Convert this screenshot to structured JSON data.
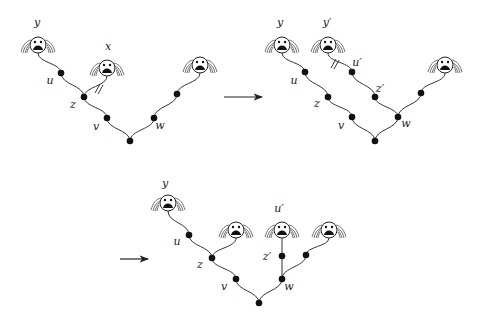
{
  "figure": {
    "panels": [
      {
        "id": "panel-1",
        "heads": [
          {
            "id": "h-y",
            "label": "y",
            "x": 38,
            "y": 45,
            "label_x": 37,
            "label_y": 26
          },
          {
            "id": "h-x",
            "label": "x",
            "x": 107,
            "y": 68,
            "label_x": 108,
            "label_y": 50
          },
          {
            "id": "h-r",
            "label": "",
            "x": 200,
            "y": 65
          }
        ],
        "nodes": [
          {
            "id": "u",
            "label": "u",
            "x": 61,
            "y": 73,
            "label_x": 50,
            "label_y": 84
          },
          {
            "id": "z",
            "label": "z",
            "x": 84,
            "y": 97,
            "label_x": 73,
            "label_y": 108
          },
          {
            "id": "v",
            "label": "v",
            "x": 107,
            "y": 118,
            "label_x": 96,
            "label_y": 130
          },
          {
            "id": "root",
            "label": "",
            "x": 130,
            "y": 141
          },
          {
            "id": "w",
            "label": "w",
            "x": 154,
            "y": 118,
            "label_x": 160,
            "label_y": 129
          },
          {
            "id": "r1",
            "label": "",
            "x": 177,
            "y": 94
          }
        ],
        "edges": [
          [
            "h-y",
            "u"
          ],
          [
            "u",
            "z"
          ],
          [
            "z",
            "h-x"
          ],
          [
            "z",
            "v"
          ],
          [
            "v",
            "root"
          ],
          [
            "root",
            "w"
          ],
          [
            "w",
            "r1"
          ],
          [
            "r1",
            "h-r"
          ]
        ],
        "cut_edge": {
          "x": 99,
          "y": 89
        }
      },
      {
        "id": "panel-2",
        "heads": [
          {
            "id": "h-y",
            "label": "y",
            "x": 282,
            "y": 45,
            "label_x": 280,
            "label_y": 26
          },
          {
            "id": "h-y2",
            "label": "y′",
            "x": 328,
            "y": 45,
            "label_x": 327,
            "label_y": 26
          },
          {
            "id": "h-r",
            "label": "",
            "x": 445,
            "y": 65
          }
        ],
        "nodes": [
          {
            "id": "u",
            "label": "u",
            "x": 305,
            "y": 72,
            "label_x": 294,
            "label_y": 84
          },
          {
            "id": "u2",
            "label": "u′",
            "x": 352,
            "y": 72,
            "label_x": 357,
            "label_y": 66
          },
          {
            "id": "z",
            "label": "z",
            "x": 328,
            "y": 97,
            "label_x": 317,
            "label_y": 107
          },
          {
            "id": "z2",
            "label": "z′",
            "x": 375,
            "y": 97,
            "label_x": 380,
            "label_y": 92
          },
          {
            "id": "v",
            "label": "v",
            "x": 352,
            "y": 117,
            "label_x": 341,
            "label_y": 129
          },
          {
            "id": "w",
            "label": "w",
            "x": 398,
            "y": 117,
            "label_x": 406,
            "label_y": 127
          },
          {
            "id": "root",
            "label": "",
            "x": 375,
            "y": 141
          },
          {
            "id": "r1",
            "label": "",
            "x": 421,
            "y": 93
          }
        ],
        "edges": [
          [
            "h-y",
            "u"
          ],
          [
            "u",
            "z"
          ],
          [
            "z",
            "v"
          ],
          [
            "v",
            "root"
          ],
          [
            "root",
            "w"
          ],
          [
            "w",
            "z2"
          ],
          [
            "z2",
            "u2"
          ],
          [
            "u2",
            "h-y2"
          ],
          [
            "w",
            "r1"
          ],
          [
            "r1",
            "h-r"
          ]
        ],
        "cut_edge": {
          "x": 335,
          "y": 64
        }
      },
      {
        "id": "panel-3",
        "heads": [
          {
            "id": "h-y",
            "label": "y",
            "x": 168,
            "y": 203,
            "label_x": 165,
            "label_y": 187
          },
          {
            "id": "h-z",
            "label": "",
            "x": 236,
            "y": 230
          },
          {
            "id": "h-u2",
            "label": "u′",
            "x": 282,
            "y": 230,
            "label_x": 279,
            "label_y": 212
          },
          {
            "id": "h-r",
            "label": "",
            "x": 329,
            "y": 230
          }
        ],
        "nodes": [
          {
            "id": "u",
            "label": "u",
            "x": 189,
            "y": 235,
            "label_x": 177,
            "label_y": 245
          },
          {
            "id": "z",
            "label": "z",
            "x": 212,
            "y": 258,
            "label_x": 200,
            "label_y": 268
          },
          {
            "id": "v",
            "label": "v",
            "x": 236,
            "y": 279,
            "label_x": 224,
            "label_y": 290
          },
          {
            "id": "root",
            "label": "",
            "x": 259,
            "y": 303
          },
          {
            "id": "w",
            "label": "w",
            "x": 282,
            "y": 279,
            "label_x": 289,
            "label_y": 290
          },
          {
            "id": "z2",
            "label": "z′",
            "x": 282,
            "y": 256,
            "label_x": 267,
            "label_y": 260
          },
          {
            "id": "r1",
            "label": "",
            "x": 306,
            "y": 255
          }
        ],
        "edges": [
          [
            "h-y",
            "u"
          ],
          [
            "u",
            "z"
          ],
          [
            "z",
            "h-z"
          ],
          [
            "z",
            "v"
          ],
          [
            "v",
            "root"
          ],
          [
            "root",
            "w"
          ],
          [
            "w",
            "z2"
          ],
          [
            "z2",
            "h-u2"
          ],
          [
            "w",
            "r1"
          ],
          [
            "r1",
            "h-r"
          ]
        ]
      }
    ],
    "arrows": [
      {
        "id": "arrow-1",
        "x1": 224,
        "y1": 97,
        "x2": 262,
        "y2": 97
      },
      {
        "id": "arrow-2",
        "x1": 120,
        "y1": 259,
        "x2": 148,
        "y2": 259
      }
    ]
  }
}
